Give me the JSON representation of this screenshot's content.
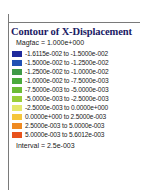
{
  "legend": {
    "title": "Contour of X-Displacement",
    "magfac_label": "Magfac =  1.000e+000",
    "interval_label": "Interval =  2.5e-003",
    "frame_color": "#7a7a7a",
    "title_color": "#1a1a64",
    "bands": [
      {
        "color": "#1f2a9c",
        "label": "-1.6115e-002 to -1.5000e-002",
        "from": -0.016115,
        "to": -0.015
      },
      {
        "color": "#2050b4",
        "label": "-1.5000e-002 to -1.2500e-002",
        "from": -0.015,
        "to": -0.0125
      },
      {
        "color": "#3f9a48",
        "label": "-1.2500e-002 to -1.0000e-002",
        "from": -0.0125,
        "to": -0.01
      },
      {
        "color": "#4aaa3c",
        "label": "-1.0000e-002 to -7.5000e-003",
        "from": -0.01,
        "to": -0.0075
      },
      {
        "color": "#6cbc36",
        "label": "-7.5000e-003 to -5.0000e-003",
        "from": -0.0075,
        "to": -0.005
      },
      {
        "color": "#9ace3a",
        "label": "-5.0000e-003 to -2.5000e-003",
        "from": -0.005,
        "to": -0.0025
      },
      {
        "color": "#e4e86a",
        "label": "-2.5000e-003 to  0.0000e+000",
        "from": -0.0025,
        "to": 0.0
      },
      {
        "color": "#f5c63c",
        "label": " 0.0000e+000 to  2.5000e-003",
        "from": 0.0,
        "to": 0.0025
      },
      {
        "color": "#ef8a22",
        "label": " 2.5000e-003 to  5.0000e-003",
        "from": 0.0025,
        "to": 0.005
      },
      {
        "color": "#e8521c",
        "label": " 5.0000e-003 to  5.6012e-003",
        "from": 0.005,
        "to": 0.0056012
      }
    ]
  },
  "chart_data": {
    "type": "bar",
    "title": "Contour of X-Displacement",
    "subtitle": "Magfac =  1.000e+000",
    "xlabel": "",
    "ylabel": "X-Displacement",
    "legend_position": "left",
    "grid": false,
    "categories": [
      "-1.6115e-002 to -1.5000e-002",
      "-1.5000e-002 to -1.2500e-002",
      "-1.2500e-002 to -1.0000e-002",
      "-1.0000e-002 to -7.5000e-003",
      "-7.5000e-003 to -5.0000e-003",
      "-5.0000e-003 to -2.5000e-003",
      "-2.5000e-003 to  0.0000e+000",
      " 0.0000e+000 to  2.5000e-003",
      " 2.5000e-003 to  5.0000e-003",
      " 5.0000e-003 to  5.6012e-003"
    ],
    "values": [
      -0.015,
      -0.0125,
      -0.01,
      -0.0075,
      -0.005,
      -0.0025,
      0.0,
      0.0025,
      0.005,
      0.0056012
    ],
    "colors": [
      "#1f2a9c",
      "#2050b4",
      "#3f9a48",
      "#4aaa3c",
      "#6cbc36",
      "#9ace3a",
      "#e4e86a",
      "#f5c63c",
      "#ef8a22",
      "#e8521c"
    ],
    "ylim": [
      -0.016115,
      0.0056012
    ],
    "interval": 0.0025,
    "interval_label": "Interval =  2.5e-003",
    "magfac": 1.0
  }
}
